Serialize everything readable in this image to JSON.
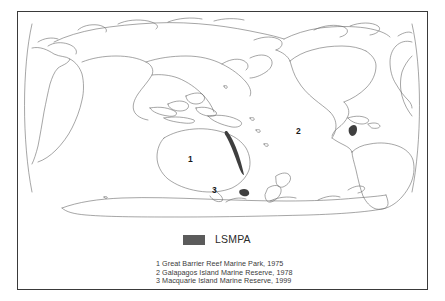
{
  "figure": {
    "map_title": "",
    "projection": "pacific-centered world outline"
  },
  "legend": {
    "key_label": "LSMPA",
    "swatch_color": "#5b5b5b",
    "notes": [
      "1 Great Barrier Reef Marine Park, 1975",
      "2 Galapagos Island Marine Reserve, 1978",
      "3 Macquarie Island Marine Reserve, 1999"
    ]
  },
  "map_markers": [
    {
      "number": "1",
      "name": "Great Barrier Reef Marine Park",
      "year": "1975",
      "region": "northeast-australia"
    },
    {
      "number": "2",
      "name": "Galapagos Island Marine Reserve",
      "year": "1978",
      "region": "eastern-pacific-ecuador"
    },
    {
      "number": "3",
      "name": "Macquarie Island Marine Reserve",
      "year": "1999",
      "region": "southern-ocean-south-of-new-zealand"
    }
  ],
  "colors": {
    "frame": "#3a3a3a",
    "coastline": "#6a6a6a",
    "marker_fill": "#3f3f3f",
    "background": "#ffffff"
  }
}
